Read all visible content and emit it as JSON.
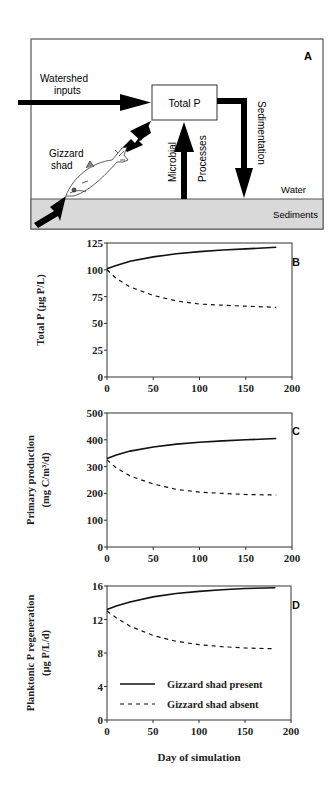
{
  "diagram": {
    "panel_label": "A",
    "labels": {
      "watershed": [
        "Watershed",
        "inputs"
      ],
      "total_p": "Total P",
      "gizzard": [
        "Gizzard",
        "shad"
      ],
      "microbial": "Microbial",
      "processes": "Processes",
      "sedimentation": "Sedimentation",
      "water": "Water",
      "sediments": "Sediments"
    },
    "colors": {
      "sediment_fill": "#d9d9d9",
      "arrow": "#000000"
    }
  },
  "legend": {
    "present": "Gizzard shad present",
    "absent": "Gizzard shad absent"
  },
  "xlabel": "Day of simulation",
  "chart_data": [
    {
      "type": "line",
      "panel": "B",
      "title": "",
      "xlabel": "Day of simulation",
      "ylabel": "Total P (µg P/L)",
      "xlim": [
        0,
        200
      ],
      "ylim": [
        0,
        125
      ],
      "xticks": [
        0,
        50,
        100,
        150,
        200
      ],
      "yticks": [
        0,
        25,
        50,
        75,
        100,
        125
      ],
      "x": [
        0,
        10,
        25,
        50,
        75,
        100,
        125,
        150,
        183
      ],
      "series": [
        {
          "name": "Gizzard shad present",
          "style": "solid",
          "values": [
            101,
            104,
            108,
            112,
            115,
            117,
            118.5,
            119.5,
            121
          ]
        },
        {
          "name": "Gizzard shad absent",
          "style": "dashed",
          "values": [
            100,
            92,
            84,
            76,
            71,
            68,
            67,
            66,
            65
          ]
        }
      ]
    },
    {
      "type": "line",
      "panel": "C",
      "title": "",
      "xlabel": "Day of simulation",
      "ylabel": "Primary production (mg C/m³/d)",
      "xlim": [
        0,
        200
      ],
      "ylim": [
        0,
        500
      ],
      "xticks": [
        0,
        50,
        100,
        150,
        200
      ],
      "yticks": [
        0,
        100,
        200,
        300,
        400,
        500
      ],
      "x": [
        0,
        10,
        25,
        50,
        75,
        100,
        125,
        150,
        183
      ],
      "series": [
        {
          "name": "Gizzard shad present",
          "style": "solid",
          "values": [
            330,
            343,
            358,
            373,
            384,
            391,
            396,
            400,
            405
          ]
        },
        {
          "name": "Gizzard shad absent",
          "style": "dashed",
          "values": [
            325,
            295,
            265,
            235,
            215,
            205,
            200,
            196,
            194
          ]
        }
      ]
    },
    {
      "type": "line",
      "panel": "D",
      "title": "",
      "xlabel": "Day of simulation",
      "ylabel": "Planktonic P regeneration (µg P/L/d)",
      "xlim": [
        0,
        200
      ],
      "ylim": [
        0,
        16
      ],
      "xticks": [
        0,
        50,
        100,
        150,
        200
      ],
      "yticks": [
        0,
        4,
        8,
        12,
        16
      ],
      "x": [
        0,
        10,
        25,
        50,
        75,
        100,
        125,
        150,
        183
      ],
      "series": [
        {
          "name": "Gizzard shad present",
          "style": "solid",
          "values": [
            13.2,
            13.6,
            14.1,
            14.7,
            15.1,
            15.35,
            15.55,
            15.7,
            15.8
          ]
        },
        {
          "name": "Gizzard shad absent",
          "style": "dashed",
          "values": [
            13.0,
            12.2,
            11.2,
            10.1,
            9.4,
            9.0,
            8.75,
            8.6,
            8.5
          ]
        }
      ],
      "legend_position": "lower-left inside"
    }
  ]
}
